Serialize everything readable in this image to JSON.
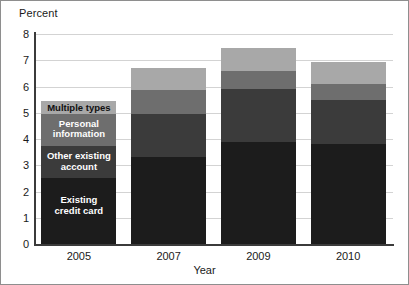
{
  "chart_data": {
    "type": "bar",
    "subtype": "stacked-bar",
    "title": "",
    "xlabel": "Year",
    "ylabel": "Percent",
    "categories": [
      "2005",
      "2007",
      "2009",
      "2010"
    ],
    "ylim": [
      0,
      8
    ],
    "yticks": [
      0,
      1,
      2,
      3,
      4,
      5,
      6,
      7,
      8
    ],
    "ytick_labels": [
      "0",
      "1",
      "2",
      "3",
      "4",
      "5",
      "6",
      "7",
      "8"
    ],
    "grid": true,
    "grid_axis": "y",
    "legend_position": "in-bar-2005",
    "stack_order": "bottom-to-top",
    "series": [
      {
        "name": "Existing credit card",
        "label_lines": "Existing\ncredit card",
        "color": "#1c1c1c",
        "text_color": "#ffffff",
        "values": [
          2.5,
          3.3,
          3.9,
          3.8
        ]
      },
      {
        "name": "Other existing account",
        "label_lines": "Other existing\naccount",
        "color": "#3b3b3b",
        "text_color": "#ffffff",
        "values": [
          1.25,
          1.65,
          2.0,
          1.7
        ]
      },
      {
        "name": "Personal information",
        "label_lines": "Personal\ninformation",
        "color": "#6e6e6e",
        "text_color": "#ffffff",
        "values": [
          1.2,
          0.9,
          0.7,
          0.6
        ]
      },
      {
        "name": "Multiple types",
        "label_lines": "Multiple types",
        "color": "#a8a8a8",
        "text_color": "#111111",
        "values": [
          0.5,
          0.85,
          0.85,
          0.85
        ]
      }
    ],
    "totals": [
      5.45,
      6.65,
      7.3,
      7.0
    ]
  }
}
